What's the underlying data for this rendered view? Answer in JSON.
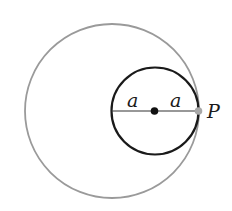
{
  "diagram": {
    "labels": {
      "left_radius": "a",
      "right_radius": "a",
      "point": "P"
    },
    "colors": {
      "outer_circle": "#9a9a9a",
      "inner_circle": "#1a1a1a",
      "point_p": "#a8a8a8",
      "center_dot": "#111111"
    },
    "outer_circle": {
      "cx": 112,
      "cy": 111,
      "r": 87
    },
    "inner_circle": {
      "cx": 155,
      "cy": 111,
      "r": 43.5
    }
  }
}
